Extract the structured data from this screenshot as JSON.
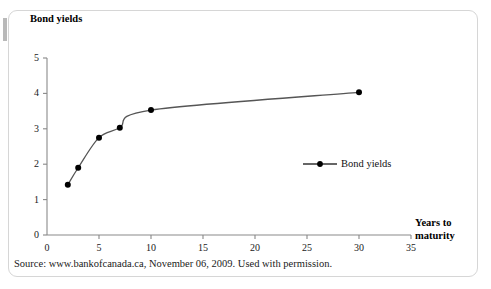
{
  "figure": {
    "source_caption": "Source: www.bankofcanada.ca, November 06, 2009. Used with permission."
  },
  "legend": {
    "entry_label": "Bond yields",
    "marker_icon": "line-with-dot-marker",
    "position": "inside-center-right"
  },
  "chart_data": {
    "type": "line",
    "title": "",
    "xlabel": "Years to maturity",
    "ylabel": "Bond yields",
    "x": [
      2,
      3,
      5,
      7,
      10,
      30
    ],
    "series": [
      {
        "name": "Bond yields",
        "values": [
          1.42,
          1.9,
          2.75,
          3.03,
          3.53,
          4.03
        ]
      }
    ],
    "xlim": [
      0,
      35
    ],
    "ylim": [
      0,
      5
    ],
    "xticks": [
      0,
      5,
      10,
      15,
      20,
      25,
      30,
      35
    ],
    "yticks": [
      0,
      1,
      2,
      3,
      4,
      5
    ],
    "xtick_labels": [
      "0",
      "5",
      "10",
      "15",
      "20",
      "25",
      "30",
      "35"
    ],
    "ytick_labels": [
      "0",
      "1",
      "2",
      "3",
      "4",
      "5"
    ],
    "grid": false,
    "line_color": "#555555",
    "marker_color": "#000000",
    "axis_color": "#888888",
    "smoothing": "curved"
  }
}
